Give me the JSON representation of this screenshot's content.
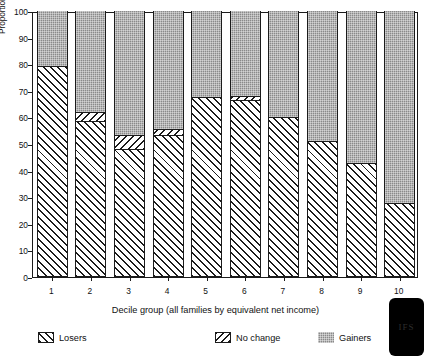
{
  "chart_data": {
    "type": "bar",
    "subtype": "stacked-percentage",
    "title": "",
    "xlabel": "Decile group (all families by equivalent net income)",
    "ylabel": "Proportions of gainers and losers in each decile (%)",
    "ylim": [
      0,
      100
    ],
    "yticks": [
      0,
      10,
      20,
      30,
      40,
      50,
      60,
      70,
      80,
      90,
      100
    ],
    "ytick_labels": [
      "0",
      "10",
      "20",
      "30",
      "40",
      "50",
      "60",
      "70",
      "80",
      "90",
      "100"
    ],
    "grid": false,
    "legend_position": "below-axis",
    "categories": [
      "1",
      "2",
      "3",
      "4",
      "5",
      "6",
      "7",
      "8",
      "9",
      "10"
    ],
    "series": [
      {
        "name": "Losers",
        "pattern": "forward-diagonal-hatch",
        "color": "#ffffff",
        "values": [
          79.5,
          58.5,
          48.0,
          53.5,
          67.5,
          66.5,
          60.0,
          51.0,
          43.0,
          28.0
        ]
      },
      {
        "name": "No change",
        "pattern": "backward-diagonal-hatch",
        "color": "#ffffff",
        "values": [
          0.0,
          3.5,
          5.5,
          2.0,
          0.0,
          1.5,
          0.0,
          0.0,
          0.0,
          0.0
        ]
      },
      {
        "name": "Gainers",
        "pattern": "grey-stipple",
        "color": "#8a8a8a",
        "values": [
          20.5,
          38.0,
          46.5,
          44.5,
          32.5,
          32.0,
          40.0,
          49.0,
          57.0,
          72.0
        ]
      }
    ]
  },
  "legend": {
    "items": [
      {
        "label": "Losers",
        "key": "losers"
      },
      {
        "label": "No change",
        "key": "nochange"
      },
      {
        "label": "Gainers",
        "key": "gainers"
      }
    ]
  },
  "publisher_mark": {
    "glyph": "IFS"
  }
}
